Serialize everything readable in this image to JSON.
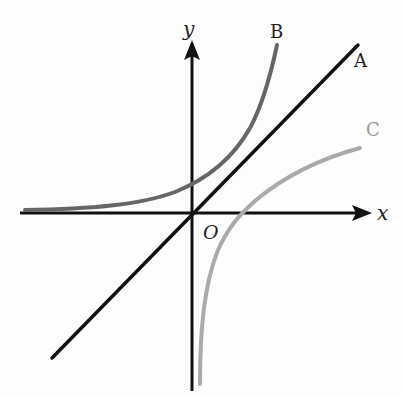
{
  "diagram": {
    "title": "",
    "axes": {
      "x_label": "x",
      "y_label": "y",
      "origin_label": "O"
    },
    "curves": [
      {
        "id": "A",
        "label": "A",
        "equation": "y = x",
        "color": "#111111",
        "description": "straight line through origin"
      },
      {
        "id": "B",
        "label": "B",
        "equation": "y = e^x",
        "color": "#666666",
        "description": "exponential curve, asymptotic to negative x-axis"
      },
      {
        "id": "C",
        "label": "C",
        "equation": "y = ln x",
        "color": "#aaaaaa",
        "description": "logarithmic curve, asymptotic to negative y-axis"
      }
    ],
    "colors": {
      "axis": "#111111",
      "line_A": "#111111",
      "curve_B": "#666666",
      "curve_C": "#aaaaaa"
    }
  }
}
